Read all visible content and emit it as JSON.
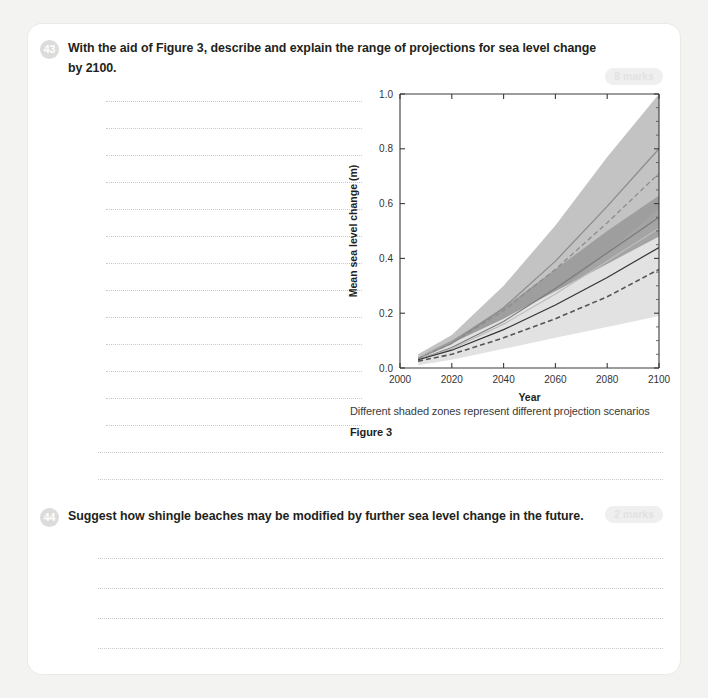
{
  "page": {
    "background": "#f3f3f1",
    "card_background": "#ffffff"
  },
  "questions": [
    {
      "number": "43",
      "text": "With the aid of Figure 3, describe and explain the range of projections for sea level change by 2100.",
      "marks": "8 marks",
      "answer_lines_short": 12,
      "answer_lines_full": 3
    },
    {
      "number": "44",
      "text": "Suggest how shingle beaches may be modified by further sea level change in the future.",
      "marks": "2 marks",
      "answer_lines_full": 4
    }
  ],
  "figure": {
    "note": "Different shaded zones represent different projection scenarios",
    "label": "Figure 3"
  },
  "chart_data": {
    "type": "area",
    "title": "",
    "xlabel": "Year",
    "ylabel": "Mean sea level change (m)",
    "xlim": [
      2000,
      2100
    ],
    "ylim": [
      0.0,
      1.0
    ],
    "xticks": [
      2000,
      2020,
      2040,
      2060,
      2080,
      2100
    ],
    "xtick_labels": [
      "2000",
      "2020",
      "2040",
      "2060",
      "2080",
      "2100"
    ],
    "yticks": [
      0.0,
      0.2,
      0.4,
      0.6,
      0.8,
      1.0
    ],
    "ytick_labels": [
      "0.0",
      "0.2",
      "0.4",
      "0.6",
      "0.8",
      "1.0"
    ],
    "grid": false,
    "legend_position": "none",
    "x": [
      2007,
      2020,
      2040,
      2060,
      2080,
      2100
    ],
    "bands": [
      {
        "name": "high-scenario-range",
        "color": "#b8b8b8",
        "opacity": 0.85,
        "lower": [
          0.02,
          0.06,
          0.15,
          0.27,
          0.42,
          0.58
        ],
        "upper": [
          0.05,
          0.12,
          0.3,
          0.52,
          0.77,
          1.0
        ]
      },
      {
        "name": "mid-scenario-range",
        "color": "#9a9a9a",
        "opacity": 0.9,
        "lower": [
          0.02,
          0.06,
          0.14,
          0.24,
          0.35,
          0.47
        ],
        "upper": [
          0.04,
          0.1,
          0.22,
          0.36,
          0.5,
          0.63
        ]
      },
      {
        "name": "low-scenario-range",
        "color": "#e2e2e2",
        "opacity": 1.0,
        "lower": [
          0.01,
          0.03,
          0.07,
          0.11,
          0.15,
          0.19
        ],
        "upper": [
          0.04,
          0.09,
          0.18,
          0.28,
          0.38,
          0.48
        ]
      }
    ],
    "series": [
      {
        "name": "high-projection-solid",
        "style": "solid",
        "color": "#8c8c8c",
        "width": 1.3,
        "values": [
          0.035,
          0.09,
          0.22,
          0.39,
          0.59,
          0.8
        ]
      },
      {
        "name": "high-projection-dashed",
        "style": "dashed",
        "color": "#8c8c8c",
        "width": 1.3,
        "values": [
          0.035,
          0.09,
          0.21,
          0.36,
          0.53,
          0.71
        ]
      },
      {
        "name": "mid-projection-solid",
        "style": "solid",
        "color": "#7a7a7a",
        "width": 1.2,
        "values": [
          0.03,
          0.075,
          0.17,
          0.29,
          0.42,
          0.55
        ]
      },
      {
        "name": "mid-projection-light",
        "style": "solid",
        "color": "#bdbdbd",
        "width": 1.2,
        "values": [
          0.03,
          0.07,
          0.16,
          0.27,
          0.39,
          0.51
        ]
      },
      {
        "name": "baseline-projection-solid",
        "style": "solid",
        "color": "#333333",
        "width": 1.2,
        "values": [
          0.03,
          0.065,
          0.14,
          0.23,
          0.33,
          0.44
        ]
      },
      {
        "name": "low-projection-dashed",
        "style": "dashed",
        "color": "#555555",
        "width": 1.6,
        "values": [
          0.025,
          0.05,
          0.11,
          0.18,
          0.26,
          0.36
        ]
      }
    ]
  }
}
